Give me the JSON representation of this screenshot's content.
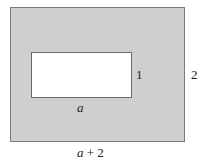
{
  "diagram": {
    "colors": {
      "shaded": "#cfcfcf",
      "inner": "#ffffff",
      "border": "#7a7a7a"
    },
    "inner_rect": {
      "width_label": "a",
      "height_label": "1"
    },
    "outer_rect": {
      "width_label_var": "a",
      "width_label_rest": " + 2",
      "height_label": "2"
    }
  }
}
